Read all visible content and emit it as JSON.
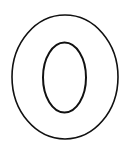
{
  "image": {
    "subject": "Letter O outline",
    "letter": "O",
    "style": "coloring page outline",
    "stroke_color": "#111111",
    "fill_color": "#ffffff",
    "background": "#ffffff"
  }
}
